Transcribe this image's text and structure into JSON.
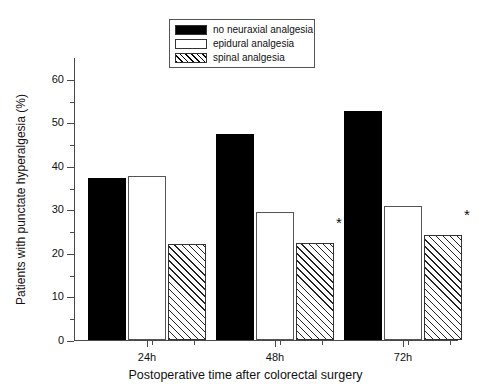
{
  "chart_data": {
    "type": "bar",
    "title": "",
    "subtitle": "",
    "xlabel": "Postoperative time after colorectal surgery",
    "ylabel": "Patients with punctate hyperalgesia (%)",
    "categories": [
      "24h",
      "48h",
      "72h"
    ],
    "ylim": [
      0,
      65
    ],
    "yticks": [
      0,
      10,
      20,
      30,
      40,
      50,
      60
    ],
    "ytick_labels": [
      "0",
      "10",
      "20",
      "30",
      "40",
      "50",
      "60"
    ],
    "y_minor_ticks": [
      5,
      15,
      25,
      35,
      45,
      55
    ],
    "grid": false,
    "legend_position": "top-center",
    "series": [
      {
        "name": "no neuraxial analgesia",
        "fill": "solid-black",
        "color": "#000000",
        "values": [
          37.1,
          47.4,
          52.6
        ]
      },
      {
        "name": "epidural analgesia",
        "fill": "open-white",
        "color": "#ffffff",
        "values": [
          37.6,
          29.3,
          30.7
        ]
      },
      {
        "name": "spinal analgesia",
        "fill": "diagonal-hatch",
        "color": "#ffffff",
        "values": [
          22.1,
          22.3,
          24.2
        ]
      }
    ],
    "annotations": [
      {
        "text": "*",
        "category": "48h",
        "series": "spinal analgesia",
        "value": 25.5
      },
      {
        "text": "*",
        "category": "72h",
        "series": "spinal analgesia",
        "value": 27.4
      }
    ]
  },
  "legend": {
    "items": [
      {
        "label": "no neuraxial analgesia",
        "swatch": "solid-black-swatch"
      },
      {
        "label": "epidural analgesia",
        "swatch": "open-white-swatch"
      },
      {
        "label": "spinal analgesia",
        "swatch": "diagonal-hatch-swatch"
      }
    ]
  },
  "axes": {
    "y_title": "Patients with punctate hyperalgesia (%)",
    "x_title": "Postoperative time after colorectal surgery",
    "y_labels": [
      "60",
      "50",
      "40",
      "30",
      "20",
      "10",
      "0"
    ],
    "x_labels": [
      "24h",
      "48h",
      "72h"
    ]
  },
  "colors": {
    "axis": "#4a4a4a",
    "text": "#111111",
    "bar_solid": "#000000",
    "bar_open_border": "#555555",
    "bar_hatch_line": "#222222",
    "background": "#ffffff"
  }
}
